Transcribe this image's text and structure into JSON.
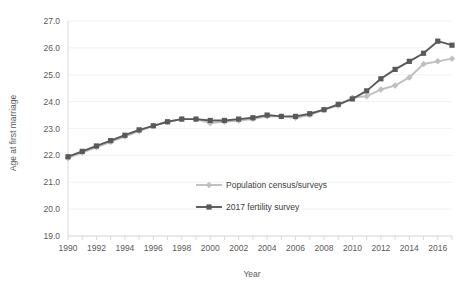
{
  "chart_data": {
    "type": "line",
    "title": "",
    "xlabel": "Year",
    "ylabel": "Age at first marriage",
    "xlim": [
      1990,
      2017
    ],
    "ylim": [
      19.0,
      27.0
    ],
    "grid": true,
    "legend_position": "inside-center-lower",
    "x": [
      1990,
      1991,
      1992,
      1993,
      1994,
      1995,
      1996,
      1997,
      1998,
      1999,
      2000,
      2001,
      2002,
      2003,
      2004,
      2005,
      2006,
      2007,
      2008,
      2009,
      2010,
      2011,
      2012,
      2013,
      2014,
      2015,
      2016,
      2017
    ],
    "xtick_labels": [
      "1990",
      "1992",
      "1994",
      "1996",
      "1998",
      "2000",
      "2002",
      "2004",
      "2006",
      "2008",
      "2010",
      "2012",
      "2014",
      "2016"
    ],
    "ytick_labels": [
      "19.0",
      "20.0",
      "21.0",
      "22.0",
      "23.0",
      "24.0",
      "25.0",
      "26.0",
      "27.0"
    ],
    "ytick_values": [
      19.0,
      20.0,
      21.0,
      22.0,
      23.0,
      24.0,
      25.0,
      26.0,
      27.0
    ],
    "series": [
      {
        "name": "Population census/surveys",
        "color": "#bfbfbf",
        "marker": "diamond",
        "values": [
          21.9,
          22.1,
          22.3,
          22.5,
          22.7,
          22.9,
          23.1,
          23.25,
          23.35,
          23.35,
          23.2,
          23.25,
          23.3,
          23.35,
          23.45,
          23.45,
          23.4,
          23.5,
          23.7,
          23.85,
          24.15,
          24.2,
          24.45,
          24.6,
          24.9,
          25.4,
          25.5,
          25.6
        ]
      },
      {
        "name": "2017 fertility survey",
        "color": "#595959",
        "marker": "square",
        "values": [
          21.95,
          22.15,
          22.35,
          22.55,
          22.75,
          22.95,
          23.1,
          23.25,
          23.35,
          23.35,
          23.3,
          23.3,
          23.35,
          23.4,
          23.5,
          23.45,
          23.45,
          23.55,
          23.7,
          23.9,
          24.1,
          24.4,
          24.85,
          25.2,
          25.5,
          25.8,
          26.25,
          26.1
        ]
      }
    ]
  },
  "legend": {
    "items": [
      {
        "label": "Population census/surveys"
      },
      {
        "label": "2017 fertility survey"
      }
    ]
  },
  "axes": {
    "y_title": "Age at first marriage",
    "x_title": "Year"
  }
}
